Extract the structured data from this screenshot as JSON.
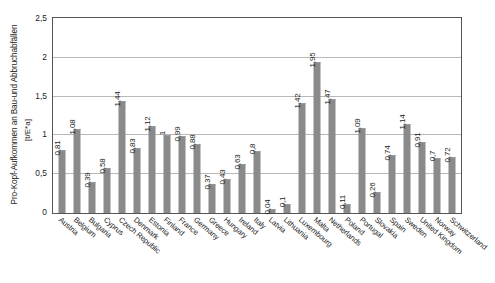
{
  "chart_data": {
    "type": "bar",
    "title": "",
    "xlabel": "",
    "ylabel": "Pro-Kopf-Aufkommen an Bau-und Abbruchabfällen",
    "yunit": "[t/E*a]",
    "ylim": [
      0,
      2.5
    ],
    "ytick_labels": [
      "0",
      "0,5",
      "1",
      "1,5",
      "2",
      "2,5"
    ],
    "ytick_values": [
      0,
      0.5,
      1,
      1.5,
      2,
      2.5
    ],
    "grid": true,
    "legend": "none",
    "decimal_separator": ",",
    "bar_color": "#8a8a8a",
    "categories": [
      "Austria",
      "Belgium",
      "Bulgaria",
      "Cyprus",
      "Czech Republic",
      "Denmark",
      "Estonia",
      "Finland",
      "France",
      "Germany",
      "Greece",
      "Hungary",
      "Ireland",
      "Italy",
      "Latvia",
      "Lithuania",
      "Luxembourg",
      "Malta",
      "Netherlands",
      "Poland",
      "Portugal",
      "Slovakia",
      "Spain",
      "Sweden",
      "United Kingdom",
      "Norway",
      "Schwitzerland"
    ],
    "values": [
      0.81,
      1.08,
      0.39,
      0.58,
      1.44,
      0.83,
      1.12,
      1,
      0.99,
      0.88,
      0.37,
      0.43,
      0.63,
      0.8,
      0.04,
      0.1,
      1.42,
      1.95,
      1.47,
      0.11,
      1.09,
      0.26,
      0.74,
      1.14,
      0.91,
      0.7,
      0.72
    ],
    "value_labels": [
      "0,81",
      "1,08",
      "0,39",
      "0,58",
      "1,44",
      "0,83",
      "1,12",
      "1",
      "0,99",
      "0,88",
      "0,37",
      "0,43",
      "0,63",
      "0,8",
      "0,04",
      "0,1",
      "1,42",
      "1,95",
      "1,47",
      "0,11",
      "1,09",
      "0,26",
      "0,74",
      "1,14",
      "0,91",
      "0,7",
      "0,72"
    ]
  }
}
